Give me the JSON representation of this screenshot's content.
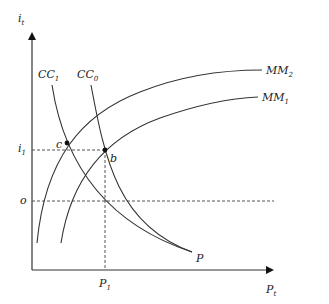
{
  "diagram": {
    "axes": {
      "y_label": "i",
      "y_label_sub": "t",
      "x_label": "P",
      "x_label_sub": "t"
    },
    "curves": {
      "cc1": {
        "label": "CC",
        "sub": "1"
      },
      "cc0": {
        "label": "CC",
        "sub": "0"
      },
      "mm2": {
        "label": "MM",
        "sub": "2"
      },
      "mm1": {
        "label": "MM",
        "sub": "1"
      }
    },
    "ticks": {
      "i1": {
        "label": "i",
        "sub": "1"
      },
      "o": {
        "label": "o"
      },
      "p1": {
        "label": "P",
        "sub": "1"
      }
    },
    "points": {
      "c": "c",
      "b": "b",
      "p": "P"
    },
    "colors": {
      "line": "#333333",
      "dashed": "#555555",
      "background": "#ffffff"
    }
  }
}
